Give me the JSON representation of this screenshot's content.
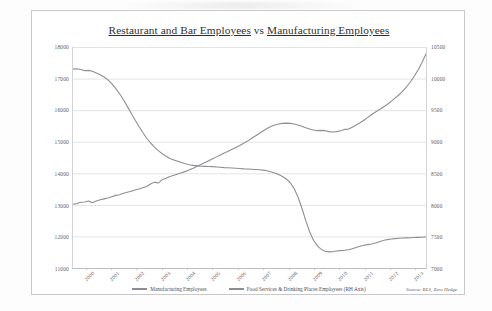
{
  "chart_data": {
    "type": "line",
    "title": "Restaurant and Bar Employees vs Manufacturing Employees",
    "title_part_1": "Restaurant and Bar Employees",
    "title_part_mid": " vs ",
    "title_part_2": "Manufacturing Employees",
    "xlabel": "",
    "ylabel": "",
    "grid": true,
    "legend_position": "bottom-center",
    "source_note": "Source: BLS, Zero Hedge",
    "x_categories": [
      "2000",
      "2001",
      "2002",
      "2003",
      "2004",
      "2005",
      "2006",
      "2007",
      "2008",
      "2009",
      "2010",
      "2011",
      "2012",
      "2013"
    ],
    "left_axis": {
      "name": "Manufacturing Employees",
      "ylim": [
        11000,
        18000
      ],
      "tick_step": 1000,
      "ticks": [
        "18000",
        "17000",
        "16000",
        "15000",
        "14000",
        "13000",
        "12000",
        "11000"
      ]
    },
    "right_axis": {
      "name": "Food Services & Drinking Places Employees",
      "ylim": [
        7000,
        10500
      ],
      "tick_step": 500,
      "ticks": [
        "10500",
        "10000",
        "9500",
        "9000",
        "8500",
        "8000",
        "7500",
        "7000"
      ]
    },
    "series": [
      {
        "name": "Manufacturing Employees",
        "axis": "left",
        "color": "#8d8d93",
        "values": [
          17300,
          17310,
          17290,
          17250,
          17260,
          17230,
          17180,
          17120,
          17050,
          16960,
          16840,
          16690,
          16520,
          16330,
          16120,
          15900,
          15690,
          15480,
          15290,
          15110,
          14960,
          14830,
          14720,
          14620,
          14540,
          14470,
          14420,
          14380,
          14340,
          14300,
          14270,
          14250,
          14235,
          14225,
          14220,
          14215,
          14210,
          14200,
          14190,
          14180,
          14175,
          14170,
          14160,
          14150,
          14140,
          14135,
          14130,
          14120,
          14110,
          14100,
          14080,
          14050,
          14010,
          13960,
          13900,
          13820,
          13700,
          13520,
          13250,
          12900,
          12500,
          12150,
          11880,
          11700,
          11590,
          11530,
          11510,
          11520,
          11540,
          11550,
          11560,
          11580,
          11610,
          11650,
          11690,
          11720,
          11740,
          11760,
          11790,
          11830,
          11870,
          11900,
          11920,
          11930,
          11940,
          11950,
          11955,
          11960,
          11965,
          11970,
          11975,
          11980
        ]
      },
      {
        "name": "Food Services & Drinking Places Employees (RH Axis)",
        "axis": "right",
        "color": "#8d8d93",
        "values": [
          8010,
          8020,
          8040,
          8045,
          8060,
          8035,
          8060,
          8080,
          8095,
          8110,
          8130,
          8150,
          8160,
          8185,
          8200,
          8215,
          8235,
          8250,
          8270,
          8290,
          8330,
          8360,
          8345,
          8400,
          8420,
          8450,
          8470,
          8490,
          8510,
          8530,
          8555,
          8580,
          8610,
          8640,
          8670,
          8700,
          8730,
          8760,
          8790,
          8820,
          8850,
          8880,
          8910,
          8940,
          8975,
          9010,
          9050,
          9090,
          9130,
          9170,
          9210,
          9240,
          9265,
          9280,
          9290,
          9295,
          9290,
          9280,
          9265,
          9245,
          9220,
          9200,
          9185,
          9175,
          9180,
          9175,
          9160,
          9155,
          9160,
          9175,
          9195,
          9200,
          9230,
          9265,
          9300,
          9340,
          9385,
          9430,
          9470,
          9510,
          9550,
          9590,
          9640,
          9690,
          9740,
          9800,
          9870,
          9950,
          10040,
          10140,
          10260,
          10390
        ]
      }
    ]
  },
  "legend": {
    "items": [
      {
        "label": "Manufacturing Employees"
      },
      {
        "label": "Food Services & Drinking Places Employees (RH Axis)"
      }
    ]
  }
}
